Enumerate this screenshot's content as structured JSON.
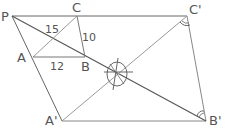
{
  "diagram": {
    "type": "geometry-homothety",
    "points": {
      "P": {
        "label": "P",
        "x": 12,
        "y": 16
      },
      "C": {
        "label": "C",
        "x": 77,
        "y": 16
      },
      "C_prime": {
        "label": "C'",
        "x": 187,
        "y": 16
      },
      "A": {
        "label": "A",
        "x": 33,
        "y": 57
      },
      "B": {
        "label": "B",
        "x": 85,
        "y": 57
      },
      "A_prime": {
        "label": "A'",
        "x": 62,
        "y": 121
      },
      "B_prime": {
        "label": "B'",
        "x": 206,
        "y": 121
      },
      "center": {
        "x": 117,
        "y": 74
      }
    },
    "measures": {
      "AC": "15",
      "CB": "10",
      "AB": "12"
    },
    "colors": {
      "dark_line": "#555555",
      "light_line": "#9a9a9a",
      "label": "#555555"
    }
  }
}
